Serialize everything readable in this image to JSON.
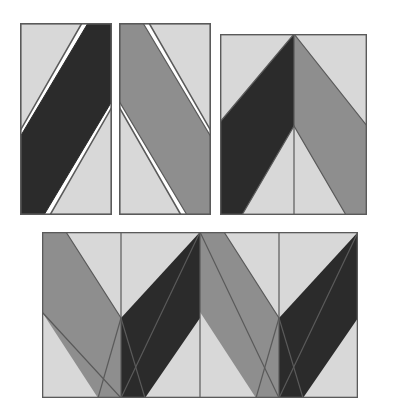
{
  "figure": {
    "background_color": "#ffffff",
    "canvas": {
      "width": 403,
      "height": 418
    }
  },
  "palette": {
    "dark": "#2b2b2b",
    "medium_gray": "#8e8e8e",
    "light_gray": "#d8d8d8",
    "outline": "#5a5a5a",
    "gap": "#ffffff"
  },
  "tile_geometry": {
    "unit_width": 92,
    "unit_height": 192,
    "band_break_fraction": 0.52,
    "note": "Each rectangular tile carries one diagonal band running corner to corner; mirrored pairs meet to form a V."
  },
  "groups": [
    {
      "id": "single-dark",
      "name": "Single tile, dark band",
      "x": 20,
      "y": 23,
      "width": 92,
      "height": 192,
      "tiles": [
        {
          "name": "tile-dark-rising",
          "band_color": "#2b2b2b",
          "field_color": "#d8d8d8",
          "band_direction": "rising",
          "has_white_gap": true
        }
      ]
    },
    {
      "id": "single-gray",
      "name": "Single tile, gray band",
      "x": 119,
      "y": 23,
      "width": 92,
      "height": 192,
      "tiles": [
        {
          "name": "tile-gray-falling",
          "band_color": "#8e8e8e",
          "field_color": "#d8d8d8",
          "band_direction": "falling",
          "has_white_gap": true
        }
      ]
    },
    {
      "id": "chevron-one",
      "name": "Two tiles joined into one chevron",
      "x": 220,
      "y": 34,
      "width": 147,
      "height": 181,
      "tiles": [
        {
          "name": "tile-dark-rising",
          "band_color": "#2b2b2b",
          "field_color": "#d8d8d8",
          "band_direction": "rising",
          "has_white_gap": false
        },
        {
          "name": "tile-gray-falling",
          "band_color": "#8e8e8e",
          "field_color": "#d8d8d8",
          "band_direction": "falling",
          "has_white_gap": false
        }
      ]
    },
    {
      "id": "chevron-row",
      "name": "Four tiles joined into a zigzag row",
      "x": 42,
      "y": 232,
      "width": 316,
      "height": 166,
      "tiles": [
        {
          "name": "tile-gray-falling",
          "band_color": "#8e8e8e",
          "field_color": "#d8d8d8",
          "band_direction": "falling",
          "has_white_gap": false
        },
        {
          "name": "tile-dark-rising",
          "band_color": "#2b2b2b",
          "field_color": "#d8d8d8",
          "band_direction": "rising",
          "has_white_gap": false
        },
        {
          "name": "tile-gray-falling",
          "band_color": "#8e8e8e",
          "field_color": "#d8d8d8",
          "band_direction": "falling",
          "has_white_gap": false
        },
        {
          "name": "tile-dark-rising",
          "band_color": "#2b2b2b",
          "field_color": "#d8d8d8",
          "band_direction": "rising",
          "has_white_gap": false
        }
      ]
    }
  ]
}
